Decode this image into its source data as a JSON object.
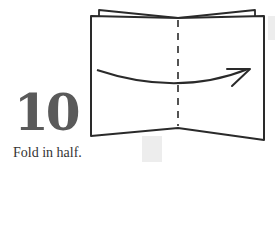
{
  "step": {
    "number": "10",
    "instruction": "Fold in half."
  },
  "diagram": {
    "fold_line": "dashed-vertical-center",
    "arrow": "curved-right",
    "colors": {
      "line": "#2a2a2a",
      "number": "#5a5a5a",
      "ghost": "#ededed"
    }
  }
}
